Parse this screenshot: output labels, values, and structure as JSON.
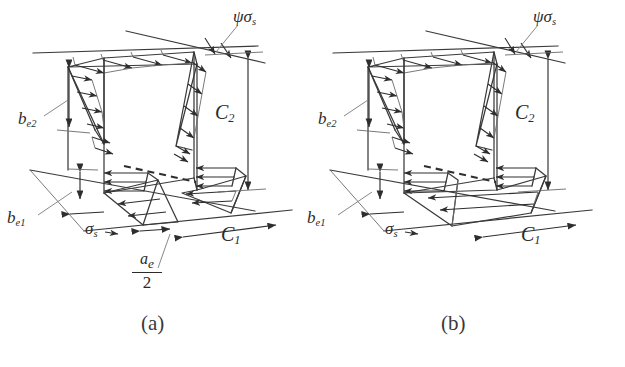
{
  "figure": {
    "type": "engineering-diagram",
    "background_color": "#ffffff",
    "line_color": "#2e2e2e",
    "panels": [
      {
        "id": "a",
        "caption": "(a)",
        "labels": {
          "top_stress": "ψσ",
          "top_stress_sub": "s",
          "side_stress": "σ",
          "side_stress_sub": "s",
          "height_dim": "C",
          "height_dim_sub": "2",
          "width_dim": "C",
          "width_dim_sub": "1",
          "upper_width": "b",
          "upper_width_sub": "e2",
          "lower_width": "b",
          "lower_width_sub": "e1",
          "fraction_numerator": "a",
          "fraction_numerator_sub": "e",
          "fraction_denominator": "2"
        }
      },
      {
        "id": "b",
        "caption": "(b)",
        "labels": {
          "top_stress": "ψσ",
          "top_stress_sub": "s",
          "side_stress": "σ",
          "side_stress_sub": "s",
          "height_dim": "C",
          "height_dim_sub": "2",
          "width_dim": "C",
          "width_dim_sub": "1",
          "upper_width": "b",
          "upper_width_sub": "e2",
          "lower_width": "b",
          "lower_width_sub": "e1"
        }
      }
    ]
  }
}
